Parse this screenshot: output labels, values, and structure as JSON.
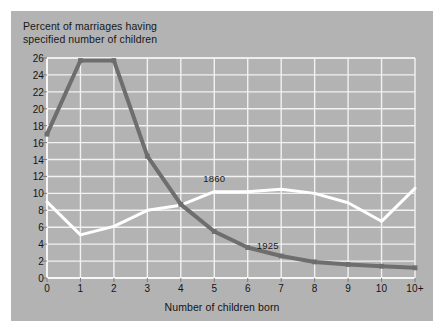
{
  "figure": {
    "background": "#ffffff",
    "panel_color": "#b3b3b3",
    "grid_color": "#f2f2f2",
    "axis_color": "#f7f7f7"
  },
  "chart_data": {
    "type": "line",
    "title": "Percent of marriages having\nspecified number of children",
    "xlabel": "Number of children born",
    "ylabel": "",
    "grid": true,
    "legend_position": "inline-annotation",
    "categories": [
      "0",
      "1",
      "2",
      "3",
      "4",
      "5",
      "6",
      "7",
      "8",
      "9",
      "10",
      "10+"
    ],
    "x": [
      0,
      1,
      2,
      3,
      4,
      5,
      6,
      7,
      8,
      9,
      10,
      11
    ],
    "xlim": [
      0,
      11
    ],
    "ylim": [
      0,
      26
    ],
    "yticks": [
      0,
      2,
      4,
      6,
      8,
      10,
      12,
      14,
      16,
      18,
      20,
      22,
      24,
      26
    ],
    "ytick_labels": [
      "0",
      "2",
      "4",
      "6",
      "8",
      "10",
      "12",
      "14",
      "16",
      "18",
      "20",
      "22",
      "24",
      "26"
    ],
    "xtick_labels": [
      "0",
      "1",
      "2",
      "3",
      "4",
      "5",
      "6",
      "7",
      "8",
      "9",
      "10",
      "10+"
    ],
    "series": [
      {
        "name": "1860",
        "color": "#ffffff",
        "label_x": 5,
        "label_y": 11.8,
        "values": [
          9.0,
          5.1,
          6.1,
          8.0,
          8.6,
          10.2,
          10.2,
          10.5,
          10.0,
          8.9,
          6.7,
          10.6
        ]
      },
      {
        "name": "1925",
        "color": "#6e6e6e",
        "label_x": 6.6,
        "label_y": 3.9,
        "values": [
          17.0,
          25.7,
          25.7,
          14.4,
          8.7,
          5.5,
          3.6,
          2.6,
          1.9,
          1.6,
          1.4,
          1.2
        ]
      }
    ]
  }
}
